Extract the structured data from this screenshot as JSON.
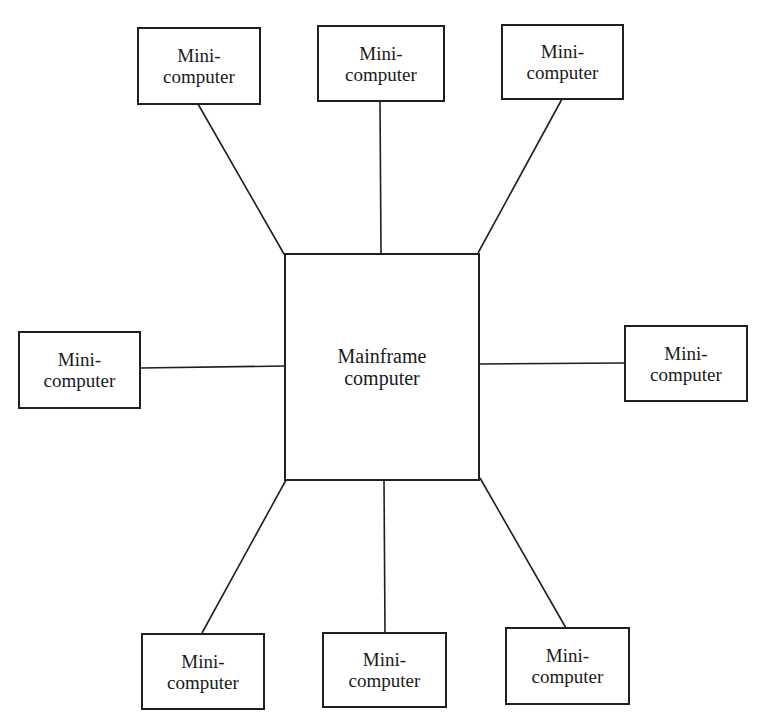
{
  "diagram": {
    "type": "star-network",
    "center": {
      "id": "mainframe",
      "line1": "Mainframe",
      "line2": "computer"
    },
    "nodes": [
      {
        "id": "mini-top-left",
        "line1": "Mini-",
        "line2": "computer"
      },
      {
        "id": "mini-top-center",
        "line1": "Mini-",
        "line2": "computer"
      },
      {
        "id": "mini-top-right",
        "line1": "Mini-",
        "line2": "computer"
      },
      {
        "id": "mini-left",
        "line1": "Mini-",
        "line2": "computer"
      },
      {
        "id": "mini-right",
        "line1": "Mini-",
        "line2": "computer"
      },
      {
        "id": "mini-bottom-left",
        "line1": "Mini-",
        "line2": "computer"
      },
      {
        "id": "mini-bottom-center",
        "line1": "Mini-",
        "line2": "computer"
      },
      {
        "id": "mini-bottom-right",
        "line1": "Mini-",
        "line2": "computer"
      }
    ],
    "edges": [
      [
        "mainframe",
        "mini-top-left"
      ],
      [
        "mainframe",
        "mini-top-center"
      ],
      [
        "mainframe",
        "mini-top-right"
      ],
      [
        "mainframe",
        "mini-left"
      ],
      [
        "mainframe",
        "mini-right"
      ],
      [
        "mainframe",
        "mini-bottom-left"
      ],
      [
        "mainframe",
        "mini-bottom-center"
      ],
      [
        "mainframe",
        "mini-bottom-right"
      ]
    ],
    "colors": {
      "line": "#1f1f1f",
      "background": "#ffffff"
    }
  }
}
